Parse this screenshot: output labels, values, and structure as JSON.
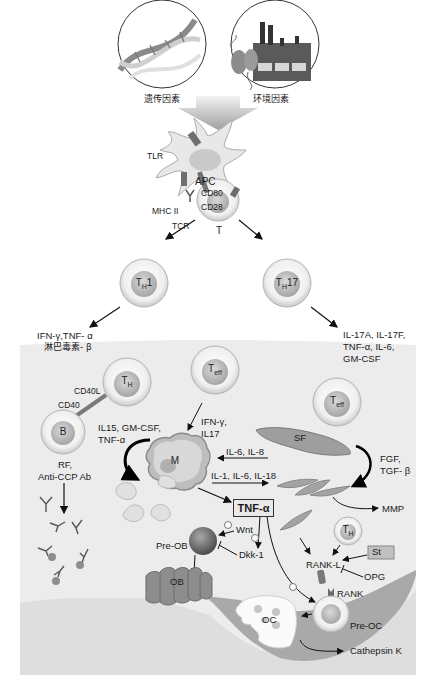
{
  "figure": {
    "top_factors": {
      "genetic_label": "遗传因素",
      "environmental_label": "环境因素"
    },
    "antigen_presentation": {
      "apc_label": "APC",
      "tlr_label": "TLR",
      "mhc_label": "MHC II",
      "tcr_label": "TCR",
      "cd80_label": "CD80",
      "cd28_label": "CD28",
      "t_cell_label": "T"
    },
    "differentiation": {
      "th1_label": "T",
      "th1_sub": "H",
      "th1_suffix": "1",
      "th17_label": "T",
      "th17_sub": "H",
      "th17_suffix": "17",
      "th1_cytokines_line1": "IFN-γ,TNF- α",
      "th1_cytokines_line2": "淋巴毒素- β",
      "th17_cytokines_line1": "IL-17A, IL-17F,",
      "th17_cytokines_line2": "TNF-α, IL-6,",
      "th17_cytokines_line3": "GM-CSF"
    },
    "synovium": {
      "th_cell_label": "T",
      "th_cell_sub": "H",
      "teff_left_label": "T",
      "teff_left_sub": "eff",
      "teff_right_label": "T",
      "teff_right_sub": "eff",
      "cd40l_label": "CD40L",
      "cd40_label": "CD40",
      "b_cell_label": "B",
      "b_output_line1": "RF,",
      "b_output_line2": "Anti-CCP Ab",
      "macrophage_label": "M",
      "macrophage_input_line1": "IL15, GM-CSF,",
      "macrophage_input_line2": "TNF-α",
      "teff_output_line1": "IFN-γ,",
      "teff_output_line2": "IL17",
      "sf_label": "SF",
      "sf_to_m_label": "IL-6, IL-8",
      "m_to_sf_label": "IL-1, IL-6, IL-18",
      "sf_growth_line1": "FGF,",
      "sf_growth_line2": "TGF- β",
      "mmp_label": "MMP",
      "tnf_label": "TNF-α"
    },
    "bone": {
      "wnt_label": "Wnt",
      "dkk_label": "Dkk-1",
      "pre_ob_label": "Pre-OB",
      "ob_label": "OB",
      "th_label": "T",
      "th_sub": "H",
      "st_label": "St",
      "rankl_label": "RANK-L",
      "opg_label": "OPG",
      "rank_label": "RANK",
      "pre_oc_label": "Pre-OC",
      "oc_label": "OC",
      "cathepsin_label": "Cathepsin K",
      "plus_symbol": "+"
    },
    "colors": {
      "panel_bg": "#ececec",
      "bone_fill": "#a9a9a9",
      "cell_fill": "#f2f2f2",
      "cell_nucleus": "#bdbdbd",
      "arrow_top": "#b5b5b5",
      "ob_fill": "#8d8d8d",
      "pre_ob_fill": "#7a7a7a"
    }
  }
}
